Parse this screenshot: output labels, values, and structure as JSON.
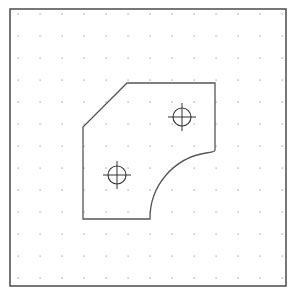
{
  "drawing": {
    "frame": {
      "x": 10,
      "y": 9,
      "width": 276,
      "height": 277,
      "stroke": "#555555"
    },
    "grid": {
      "x0": 18,
      "y0": 14,
      "spacing": 22,
      "cols": 13,
      "rows": 13,
      "dot_color": "#9a9a9a"
    },
    "part_outline": {
      "stroke": "#555555",
      "path": "M 83 219 L 83 127 L 127 83 L 215 83 L 215 150 Q 215 152 206 153 A 66 66 0 0 0 150 219 L 150 219 Z"
    },
    "holes": [
      {
        "name": "hole-upper-right",
        "cx": 182,
        "cy": 117,
        "r": 9,
        "cross": 14
      },
      {
        "name": "hole-lower-left",
        "cx": 117,
        "cy": 175,
        "r": 9,
        "cross": 14
      }
    ]
  }
}
